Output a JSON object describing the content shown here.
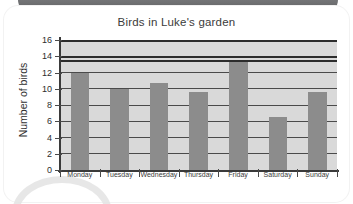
{
  "card": {
    "decorations": {
      "top_tab": "grey-rounded-tab",
      "corner_circle": "grey-circle-arc"
    }
  },
  "chart_data": {
    "type": "bar",
    "title": "Birds in Luke's garden",
    "xlabel": "",
    "ylabel": "Number of birds",
    "categories": [
      "Monday",
      "Tuesday",
      "Wednesday",
      "Thursday",
      "Friday",
      "Saturday",
      "Sunday"
    ],
    "values": [
      12,
      10,
      10.7,
      9.6,
      13.3,
      6.5,
      9.6
    ],
    "ylim": [
      0,
      16
    ],
    "ytick_labels": [
      "0",
      "2",
      "4",
      "6",
      "8",
      "10",
      "12",
      "14",
      "16"
    ],
    "ytick_values": [
      0,
      2,
      4,
      6,
      8,
      10,
      12,
      14,
      16
    ],
    "grid": true,
    "legend": "none",
    "bar_color": "#8c8c8c",
    "plot_background": "#d9d9d9",
    "axis_color": "#3a3a3a",
    "gridline_color": "#4a4a4a"
  }
}
